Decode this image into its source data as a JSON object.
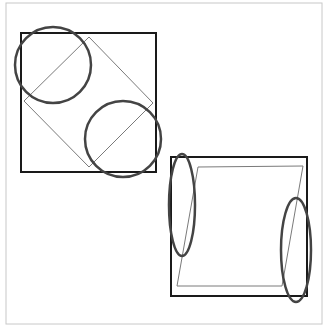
{
  "diagram": {
    "type": "geometric-figures",
    "colors": {
      "background": "#ffffff",
      "frame": "#c8c8c8",
      "outer_square": "#1a1a1a",
      "inner_shape": "#7a7a7a",
      "highlight": "#444444"
    },
    "frame": {
      "x": 6,
      "y": 3,
      "width": 316,
      "height": 321
    },
    "figures": [
      {
        "name": "figure-1",
        "square": {
          "x": 21,
          "y": 33,
          "width": 135,
          "height": 139
        },
        "inner_shape": "diamond",
        "inner_points": "89,37 153,103 89,167 24,101",
        "highlights": [
          {
            "kind": "circle",
            "cx": 53,
            "cy": 65,
            "r": 38
          },
          {
            "kind": "circle",
            "cx": 123,
            "cy": 139,
            "r": 38
          }
        ]
      },
      {
        "name": "figure-2",
        "square": {
          "x": 171,
          "y": 157,
          "width": 136,
          "height": 139
        },
        "inner_shape": "parallelogram",
        "inner_points": "198,167 303,166 282,286 177,286",
        "highlights": [
          {
            "kind": "ellipse",
            "cx": 182,
            "cy": 205,
            "rx": 13,
            "ry": 51
          },
          {
            "kind": "ellipse",
            "cx": 296,
            "cy": 250,
            "rx": 15,
            "ry": 52
          }
        ]
      }
    ]
  }
}
